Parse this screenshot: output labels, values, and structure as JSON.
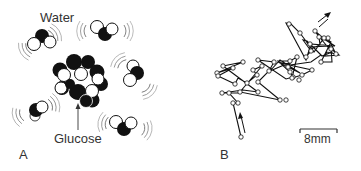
{
  "panels": [
    {
      "id": "A",
      "label": "A",
      "title_label": "Water",
      "pointer_label": "Glucose",
      "description": "Water molecules moving around a glucose molecule"
    },
    {
      "id": "B",
      "label": "B",
      "scale_bar_label": "8mm",
      "description": "Random walk path"
    }
  ],
  "colors": {
    "ink": "#111111",
    "text": "#333333",
    "background": "#ffffff"
  }
}
